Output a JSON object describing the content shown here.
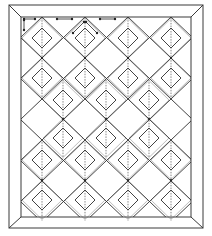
{
  "diagram": {
    "title": "Quilt pattern: diamond lattice with mitered border",
    "colors": {
      "line": "#2e2e2e",
      "background": "#ffffff"
    },
    "outer_frame": {
      "x1": 9,
      "y1": 5,
      "x2": 203,
      "y2": 228
    },
    "inner_frame": {
      "x1": 21,
      "y1": 17,
      "x2": 191,
      "y2": 217
    },
    "lattice": {
      "columns_even": [
        42,
        85,
        128,
        171
      ],
      "columns_odd": [
        21,
        63,
        106,
        149,
        191
      ],
      "big_half_w": 21.5,
      "big_half_h": 20.5
    },
    "small_diamonds": [
      {
        "cx": 42,
        "cy": 38
      },
      {
        "cx": 85,
        "cy": 38
      },
      {
        "cx": 128,
        "cy": 38
      },
      {
        "cx": 171,
        "cy": 38
      },
      {
        "cx": 42,
        "cy": 78
      },
      {
        "cx": 85,
        "cy": 78
      },
      {
        "cx": 128,
        "cy": 78
      },
      {
        "cx": 171,
        "cy": 78
      },
      {
        "cx": 63,
        "cy": 100
      },
      {
        "cx": 106,
        "cy": 100
      },
      {
        "cx": 149,
        "cy": 100
      },
      {
        "cx": 63,
        "cy": 138
      },
      {
        "cx": 106,
        "cy": 138
      },
      {
        "cx": 149,
        "cy": 138
      },
      {
        "cx": 42,
        "cy": 160
      },
      {
        "cx": 85,
        "cy": 160
      },
      {
        "cx": 128,
        "cy": 160
      },
      {
        "cx": 171,
        "cy": 160
      },
      {
        "cx": 42,
        "cy": 200
      },
      {
        "cx": 85,
        "cy": 200
      },
      {
        "cx": 128,
        "cy": 200
      },
      {
        "cx": 171,
        "cy": 200
      }
    ],
    "small_half": 10,
    "nodes": [
      {
        "x": 42,
        "y": 58
      },
      {
        "x": 85,
        "y": 58
      },
      {
        "x": 128,
        "y": 58
      },
      {
        "x": 171,
        "y": 58
      },
      {
        "x": 63,
        "y": 119
      },
      {
        "x": 106,
        "y": 119
      },
      {
        "x": 149,
        "y": 119
      },
      {
        "x": 42,
        "y": 180
      },
      {
        "x": 85,
        "y": 180
      },
      {
        "x": 128,
        "y": 180
      },
      {
        "x": 171,
        "y": 180
      }
    ],
    "annotations": [
      {
        "type": "arrow-h",
        "x1": 24,
        "x2": 35,
        "y": 19
      },
      {
        "type": "arrow-v",
        "x": 24,
        "y1": 20,
        "y2": 30
      },
      {
        "type": "arrow-h",
        "x1": 57,
        "x2": 72,
        "y": 19
      },
      {
        "type": "arrow-h",
        "x1": 100,
        "x2": 115,
        "y": 19
      },
      {
        "type": "arrow-d",
        "x1": 73,
        "y1": 33,
        "x2": 84,
        "y2": 22
      },
      {
        "type": "arrow-d",
        "x1": 86,
        "y1": 22,
        "x2": 97,
        "y2": 33
      }
    ]
  }
}
